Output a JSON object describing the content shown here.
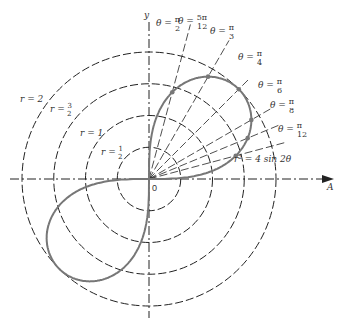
{
  "diagram": {
    "type": "polar-plot",
    "equation": "r² = 4 sin 2θ",
    "origin_label": "0",
    "axes": {
      "x_label": "A",
      "y_label": "y"
    },
    "circles": [
      {
        "r": 0.5,
        "label": "r = 1/2"
      },
      {
        "r": 1,
        "label": "r = 1"
      },
      {
        "r": 1.5,
        "label": "r = 3/2"
      },
      {
        "r": 2,
        "label": "r = 2"
      }
    ],
    "rays": [
      {
        "angle_deg": 90,
        "label_num": "π",
        "label_den": "2"
      },
      {
        "angle_deg": 75,
        "label_num": "5π",
        "label_den": "12"
      },
      {
        "angle_deg": 60,
        "label_num": "π",
        "label_den": "3"
      },
      {
        "angle_deg": 45,
        "label_num": "π",
        "label_den": "4"
      },
      {
        "angle_deg": 30,
        "label_num": "π",
        "label_den": "6"
      },
      {
        "angle_deg": 22.5,
        "label_num": "π",
        "label_den": "8"
      },
      {
        "angle_deg": 15,
        "label_num": "π",
        "label_den": "12"
      }
    ],
    "theta_prefix": "θ =",
    "colors": {
      "curve": "#777777",
      "lines": "#222222",
      "points": "#777777"
    }
  }
}
